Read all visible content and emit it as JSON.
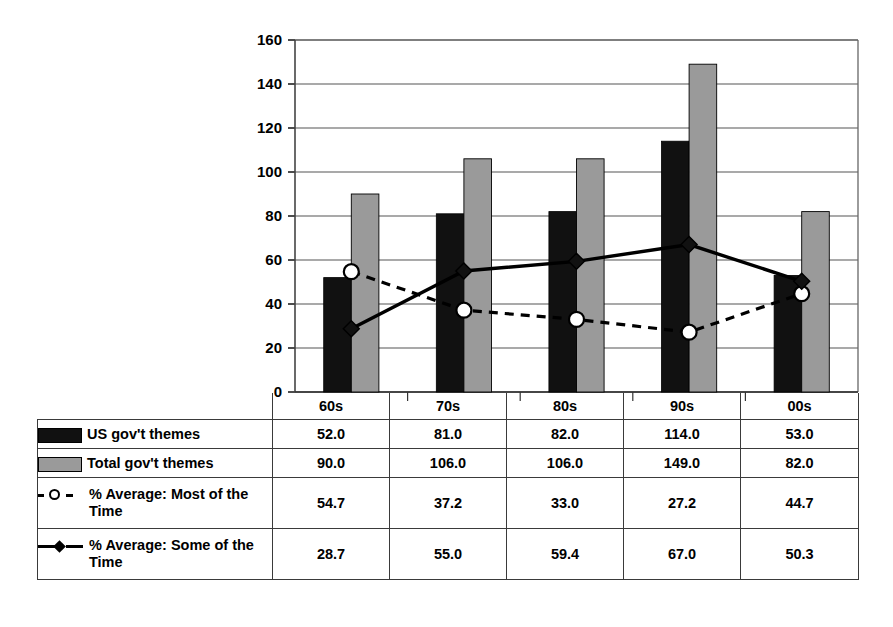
{
  "chart_data": {
    "type": "bar",
    "title": "",
    "xlabel": "",
    "ylabel": "",
    "ylim": [
      0,
      160
    ],
    "yticks": [
      0,
      20,
      40,
      60,
      80,
      100,
      120,
      140,
      160
    ],
    "grid": true,
    "legend_position": "table-below",
    "categories": [
      "60s",
      "70s",
      "80s",
      "90s",
      "00s"
    ],
    "series": [
      {
        "name": "US gov't themes",
        "kind": "bar",
        "color": "#111111",
        "values": [
          52.0,
          81.0,
          82.0,
          114.0,
          53.0
        ],
        "labels": [
          "52.0",
          "81.0",
          "82.0",
          "114.0",
          "53.0"
        ]
      },
      {
        "name": "Total gov't themes",
        "kind": "bar",
        "color": "#9a9a9a",
        "values": [
          90.0,
          106.0,
          106.0,
          149.0,
          82.0
        ],
        "labels": [
          "90.0",
          "106.0",
          "106.0",
          "149.0",
          "82.0"
        ]
      },
      {
        "name": "% Average: Most of the Time",
        "kind": "line",
        "style": "dashed",
        "marker": "circle-open",
        "color": "#000000",
        "values": [
          54.7,
          37.2,
          33.0,
          27.2,
          44.7
        ],
        "labels": [
          "54.7",
          "37.2",
          "33.0",
          "27.2",
          "44.7"
        ]
      },
      {
        "name": "% Average: Some of the Time",
        "kind": "line",
        "style": "solid",
        "marker": "diamond-filled",
        "color": "#000000",
        "values": [
          28.7,
          55.0,
          59.4,
          67.0,
          50.3
        ],
        "labels": [
          "28.7",
          "55.0",
          "59.4",
          "67.0",
          "50.3"
        ]
      }
    ]
  },
  "table": {
    "corner_label": "",
    "columns": [
      "60s",
      "70s",
      "80s",
      "90s",
      "00s"
    ],
    "rows": [
      {
        "key": "black-swatch",
        "label": "US gov't themes",
        "values": [
          "52.0",
          "81.0",
          "82.0",
          "114.0",
          "53.0"
        ]
      },
      {
        "key": "gray-swatch",
        "label": "Total gov't themes",
        "values": [
          "90.0",
          "106.0",
          "106.0",
          "149.0",
          "82.0"
        ]
      },
      {
        "key": "dashed-circle",
        "label": "% Average: Most of the Time",
        "values": [
          "54.7",
          "37.2",
          "33.0",
          "27.2",
          "44.7"
        ]
      },
      {
        "key": "solid-diamond",
        "label": "% Average: Some of the Time",
        "values": [
          "28.7",
          "55.0",
          "59.4",
          "67.0",
          "50.3"
        ]
      }
    ]
  },
  "axis": {
    "ytick_labels": [
      "160",
      "140",
      "120",
      "100",
      "80",
      "60",
      "40",
      "20",
      "0"
    ]
  }
}
